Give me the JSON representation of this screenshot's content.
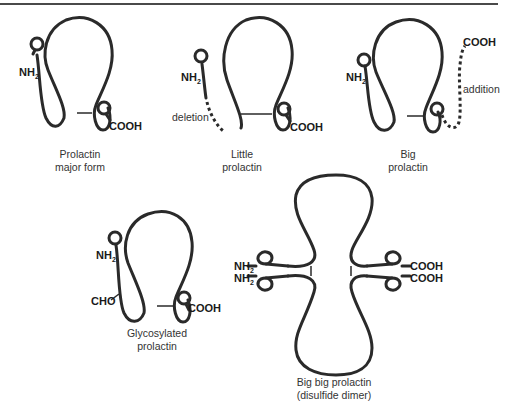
{
  "diagram": {
    "colors": {
      "stroke": "#2a2a2a",
      "text": "#1a1a1a",
      "caption": "#333333",
      "rule": "#4a4a4a"
    },
    "panels": [
      {
        "id": "major",
        "caption_line1": "Prolactin",
        "caption_line2": "major form",
        "n_terminus": "NH",
        "n_sub": "2",
        "c_terminus": "COOH"
      },
      {
        "id": "little",
        "caption_line1": "Little",
        "caption_line2": "prolactin",
        "n_terminus": "NH",
        "n_sub": "2",
        "c_terminus": "COOH",
        "annotation": "deletion"
      },
      {
        "id": "big",
        "caption_line1": "Big",
        "caption_line2": "prolactin",
        "n_terminus": "NH",
        "n_sub": "2",
        "c_terminus": "COOH",
        "annotation": "addition"
      },
      {
        "id": "glycosylated",
        "caption_line1": "Glycosylated",
        "caption_line2": "prolactin",
        "n_terminus": "NH",
        "n_sub": "2",
        "c_terminus": "COOH",
        "annotation": "CHO"
      },
      {
        "id": "bigbig",
        "caption_line1": "Big big prolactin",
        "caption_line2": "(disulfide dimer)",
        "n_terminus_1": "NH",
        "n_terminus_2": "NH",
        "n_sub": "2",
        "c_terminus_1": "COOH",
        "c_terminus_2": "COOH"
      }
    ]
  }
}
